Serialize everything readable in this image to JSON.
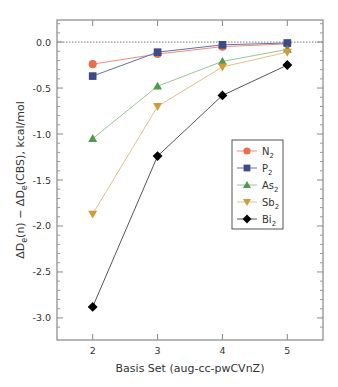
{
  "chart_data": {
    "type": "line",
    "title": "",
    "xlabel": "Basis Set (aug-cc-pwCVnZ)",
    "ylabel": "ΔDe(n) − ΔDe(CBS), kcal/mol",
    "x": [
      2,
      3,
      4,
      5
    ],
    "xticks": [
      "2",
      "3",
      "4",
      "5"
    ],
    "xlim": [
      1.45,
      5.55
    ],
    "ylim": [
      -3.24,
      0.24
    ],
    "yticks": [
      "0.0",
      "-0.5",
      "-1.0",
      "-1.5",
      "-2.0",
      "-2.5",
      "-3.0"
    ],
    "ytick_values": [
      0.0,
      -0.5,
      -1.0,
      -1.5,
      -2.0,
      -2.5,
      -3.0
    ],
    "reference_line": {
      "y": 0.0,
      "style": "dotted"
    },
    "grid": false,
    "legend_position": "right-middle",
    "series": [
      {
        "name": "N2",
        "base": "N",
        "sub": "2",
        "marker": "circle",
        "color": "#e8704a",
        "line_color": "#e89080",
        "values": [
          -0.24,
          -0.13,
          -0.05,
          -0.02
        ]
      },
      {
        "name": "P2",
        "base": "P",
        "sub": "2",
        "marker": "square",
        "color": "#3d4b8a",
        "line_color": "#6670a8",
        "values": [
          -0.37,
          -0.11,
          -0.03,
          -0.01
        ]
      },
      {
        "name": "As2",
        "base": "As",
        "sub": "2",
        "marker": "triangle-up",
        "color": "#4f9a4f",
        "line_color": "#9ac49a",
        "values": [
          -1.05,
          -0.48,
          -0.21,
          -0.08
        ]
      },
      {
        "name": "Sb2",
        "base": "Sb",
        "sub": "2",
        "marker": "triangle-down",
        "color": "#d39a3a",
        "line_color": "#e3c088",
        "values": [
          -1.87,
          -0.7,
          -0.27,
          -0.11
        ]
      },
      {
        "name": "Bi2",
        "base": "Bi",
        "sub": "2",
        "marker": "diamond",
        "color": "#000000",
        "line_color": "#555555",
        "values": [
          -2.88,
          -1.24,
          -0.58,
          -0.25
        ]
      }
    ]
  }
}
